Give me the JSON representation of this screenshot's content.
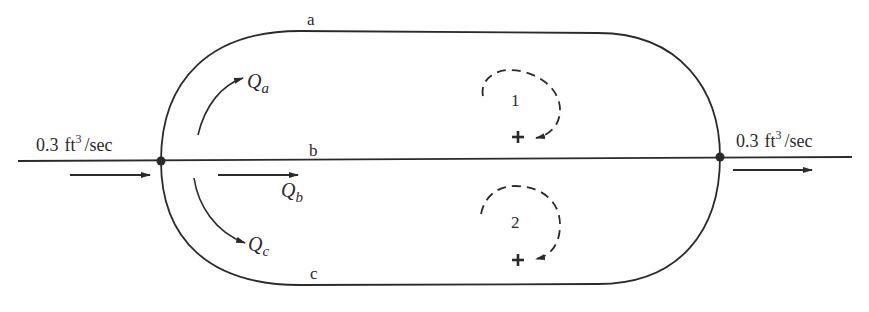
{
  "diagram": {
    "type": "pipe-network",
    "inflow": {
      "value": "0.3",
      "unit_base": "ft",
      "unit_exp": "3",
      "unit_rest": "/sec"
    },
    "outflow": {
      "value": "0.3",
      "unit_base": "ft",
      "unit_exp": "3",
      "unit_rest": "/sec"
    },
    "pipes": [
      {
        "id": "a",
        "label": "a"
      },
      {
        "id": "b",
        "label": "b"
      },
      {
        "id": "c",
        "label": "c"
      }
    ],
    "flows": [
      {
        "symbol": "Q",
        "subscript": "a"
      },
      {
        "symbol": "Q",
        "subscript": "b"
      },
      {
        "symbol": "Q",
        "subscript": "c"
      }
    ],
    "loops": [
      {
        "label": "1",
        "sign": "+"
      },
      {
        "label": "2",
        "sign": "+"
      }
    ],
    "colors": {
      "line": "#2a2a2a",
      "background": "#ffffff"
    }
  }
}
